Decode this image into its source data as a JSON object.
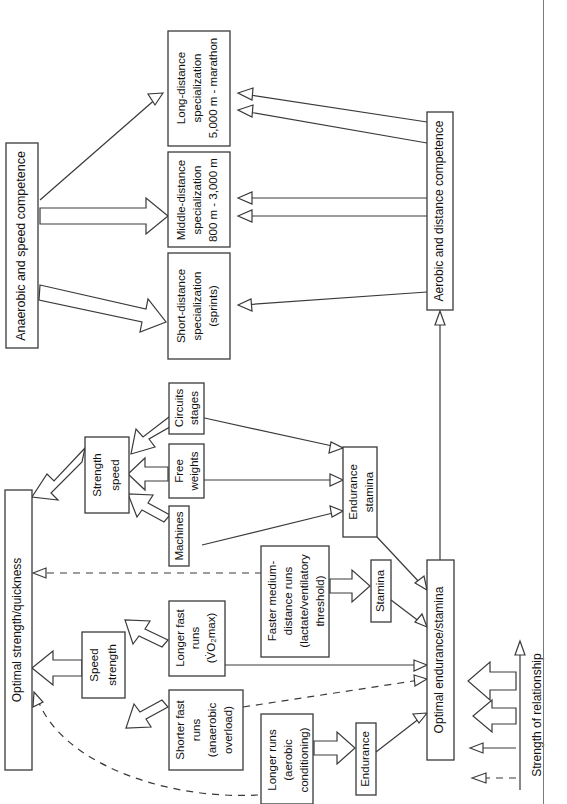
{
  "diagram": {
    "orientation": "rotated-90-ccw",
    "legend": {
      "axis_label": "Strength of relationship",
      "items": [
        {
          "name": "very-strong",
          "style": "thick-hollow-large"
        },
        {
          "name": "strong",
          "style": "thick-hollow-small"
        },
        {
          "name": "moderate",
          "style": "thin-solid"
        },
        {
          "name": "weak",
          "style": "dashed"
        }
      ]
    },
    "nodes": {
      "anaerobic_speed_competence": "Anaerobic and speed competence",
      "aerobic_distance_competence": "Aerobic and distance competence",
      "short_distance": "Short-distance\nspecialization\n(sprints)",
      "short_distance_l1": "Short-distance",
      "short_distance_l2": "specialization",
      "short_distance_l3": "(sprints)",
      "middle_distance_l1": "Middle-distance",
      "middle_distance_l2": "specialization",
      "middle_distance_l3": "800 m - 3,000 m",
      "long_distance_l1": "Long-distance",
      "long_distance_l2": "specialization",
      "long_distance_l3": "5,000 m - marathon",
      "optimal_strength_quickness": "Optimal strength/quickness",
      "optimal_endurance_stamina": "Optimal endurance/stamina",
      "strength_speed_l1": "Strength",
      "strength_speed_l2": "speed",
      "speed_strength_l1": "Speed",
      "speed_strength_l2": "strength",
      "endurance_stamina_l1": "Endurance",
      "endurance_stamina_l2": "stamina",
      "stamina": "Stamina",
      "endurance": "Endurance",
      "circuits_l1": "Circuits",
      "circuits_l2": "stages",
      "free_weights_l1": "Free",
      "free_weights_l2": "weights",
      "machines": "Machines",
      "longer_fast_runs_l1": "Longer fast",
      "longer_fast_runs_l2": "runs",
      "longer_fast_runs_l3": "(V̇O₂max)",
      "shorter_fast_runs_l1": "Shorter fast",
      "shorter_fast_runs_l2": "runs",
      "shorter_fast_runs_l3": "(anaerobic",
      "shorter_fast_runs_l4": "overload)",
      "faster_medium_l1": "Faster medium-",
      "faster_medium_l2": "distance runs",
      "faster_medium_l3": "(lactate/ventilatory",
      "faster_medium_l4": "threshold)",
      "longer_runs_l1": "Longer runs",
      "longer_runs_l2": "(aerobic",
      "longer_runs_l3": "conditioning)"
    },
    "colors": {
      "stroke": "#3a3a3a",
      "text": "#101010",
      "background": "#ffffff",
      "frame": "#7a7a7a"
    }
  }
}
